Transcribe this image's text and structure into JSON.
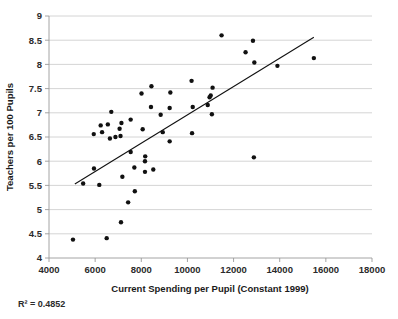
{
  "chart_data": {
    "type": "scatter",
    "title": "",
    "xlabel": "Current Spending per Pupil (Constant 1999)",
    "ylabel": "Teachers per 100 Pupils",
    "xlim": [
      4000,
      18000
    ],
    "ylim": [
      4,
      9
    ],
    "x_ticks": [
      4000,
      6000,
      8000,
      10000,
      12000,
      14000,
      16000,
      18000
    ],
    "y_ticks": [
      4,
      4.5,
      5,
      5.5,
      6,
      6.5,
      7,
      7.5,
      8,
      8.5,
      9
    ],
    "x_tick_labels": [
      "4000",
      "6000",
      "8000",
      "10000",
      "12000",
      "14000",
      "16000",
      "18000"
    ],
    "y_tick_labels": [
      "4",
      "4.5",
      "5",
      "5.5",
      "6",
      "6.5",
      "7",
      "7.5",
      "8",
      "8.5",
      "9"
    ],
    "grid": "horizontal",
    "legend": "none",
    "marker_color": "#111111",
    "gridline_color": "#c9c9c9",
    "annotation": "R² = 0.4852",
    "r_squared": 0.4852,
    "trendline": {
      "type": "linear",
      "x_start": 5120,
      "y_start": 5.53,
      "x_end": 15480,
      "y_end": 8.56
    },
    "points": [
      {
        "x": 5040,
        "y": 4.38
      },
      {
        "x": 6500,
        "y": 4.41
      },
      {
        "x": 7120,
        "y": 4.74
      },
      {
        "x": 7430,
        "y": 5.15
      },
      {
        "x": 7720,
        "y": 5.38
      },
      {
        "x": 5480,
        "y": 5.54
      },
      {
        "x": 6180,
        "y": 5.51
      },
      {
        "x": 5950,
        "y": 5.85
      },
      {
        "x": 7180,
        "y": 5.68
      },
      {
        "x": 7700,
        "y": 5.87
      },
      {
        "x": 8160,
        "y": 5.78
      },
      {
        "x": 8520,
        "y": 5.83
      },
      {
        "x": 8160,
        "y": 6.0
      },
      {
        "x": 8170,
        "y": 6.1
      },
      {
        "x": 7540,
        "y": 6.19
      },
      {
        "x": 12880,
        "y": 6.08
      },
      {
        "x": 9230,
        "y": 6.41
      },
      {
        "x": 8930,
        "y": 6.6
      },
      {
        "x": 10200,
        "y": 6.58
      },
      {
        "x": 5940,
        "y": 6.56
      },
      {
        "x": 6300,
        "y": 6.6
      },
      {
        "x": 6240,
        "y": 6.74
      },
      {
        "x": 6550,
        "y": 6.76
      },
      {
        "x": 6640,
        "y": 6.47
      },
      {
        "x": 6880,
        "y": 6.5
      },
      {
        "x": 7100,
        "y": 6.52
      },
      {
        "x": 7060,
        "y": 6.67
      },
      {
        "x": 7140,
        "y": 6.79
      },
      {
        "x": 8060,
        "y": 6.66
      },
      {
        "x": 7540,
        "y": 6.86
      },
      {
        "x": 6700,
        "y": 7.02
      },
      {
        "x": 8840,
        "y": 6.96
      },
      {
        "x": 11060,
        "y": 6.97
      },
      {
        "x": 8420,
        "y": 7.12
      },
      {
        "x": 9230,
        "y": 7.1
      },
      {
        "x": 10230,
        "y": 7.12
      },
      {
        "x": 10880,
        "y": 7.16
      },
      {
        "x": 10960,
        "y": 7.32
      },
      {
        "x": 11010,
        "y": 7.36
      },
      {
        "x": 8010,
        "y": 7.4
      },
      {
        "x": 9260,
        "y": 7.42
      },
      {
        "x": 8440,
        "y": 7.55
      },
      {
        "x": 11090,
        "y": 7.52
      },
      {
        "x": 10180,
        "y": 7.66
      },
      {
        "x": 13900,
        "y": 7.97
      },
      {
        "x": 12900,
        "y": 8.04
      },
      {
        "x": 15480,
        "y": 8.13
      },
      {
        "x": 12520,
        "y": 8.25
      },
      {
        "x": 12840,
        "y": 8.49
      },
      {
        "x": 11480,
        "y": 8.6
      }
    ]
  }
}
